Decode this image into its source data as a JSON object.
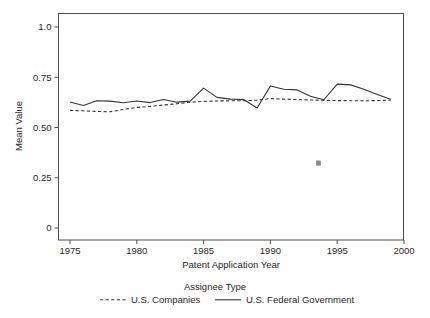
{
  "chart_data": {
    "type": "line",
    "title": "",
    "xlabel": "Patent Application Year",
    "ylabel": "Mean Value",
    "xlim": [
      1974,
      2000
    ],
    "ylim": [
      0,
      1.0
    ],
    "grid": false,
    "legend_position": "bottom",
    "legend_title": "Assignee Type",
    "xticks": [
      "1975",
      "1980",
      "1985",
      "1990",
      "1995",
      "2000"
    ],
    "xtick_values": [
      1975,
      1980,
      1985,
      1990,
      1995,
      2000
    ],
    "yticks": [
      "0",
      "0.25",
      "0.50",
      "0.75",
      "1.0"
    ],
    "ytick_values": [
      0,
      0.25,
      0.5,
      0.75,
      1.0
    ],
    "x": [
      1975,
      1976,
      1977,
      1978,
      1979,
      1980,
      1981,
      1982,
      1983,
      1984,
      1985,
      1986,
      1987,
      1988,
      1989,
      1990,
      1991,
      1992,
      1993,
      1994,
      1995,
      1996,
      1997,
      1998,
      1999
    ],
    "series": [
      {
        "name": "U.S. Companies",
        "style": "dashed",
        "color": "#333333",
        "values": [
          0.585,
          0.583,
          0.58,
          0.578,
          0.59,
          0.6,
          0.605,
          0.612,
          0.618,
          0.626,
          0.63,
          0.632,
          0.633,
          0.633,
          0.636,
          0.644,
          0.641,
          0.639,
          0.637,
          0.635,
          0.634,
          0.633,
          0.633,
          0.634,
          0.636
        ]
      },
      {
        "name": "U.S. Federal Government",
        "style": "solid",
        "color": "#333333",
        "values": [
          0.627,
          0.609,
          0.633,
          0.631,
          0.623,
          0.632,
          0.624,
          0.639,
          0.626,
          0.631,
          0.696,
          0.65,
          0.641,
          0.639,
          0.597,
          0.706,
          0.69,
          0.687,
          0.655,
          0.638,
          0.716,
          0.712,
          0.69,
          0.664,
          0.641
        ]
      }
    ],
    "markers": [
      {
        "name": "outlier-point",
        "x": 1993.6,
        "y": 0.323,
        "color": "#8c8c8c"
      }
    ]
  },
  "legend": {
    "title": "Assignee Type",
    "entries": [
      {
        "label": "U.S. Companies",
        "style": "dashed"
      },
      {
        "label": "U.S. Federal Government",
        "style": "solid"
      }
    ]
  },
  "axes": {
    "x_title": "Patent Application Year",
    "y_title": "Mean Value"
  }
}
